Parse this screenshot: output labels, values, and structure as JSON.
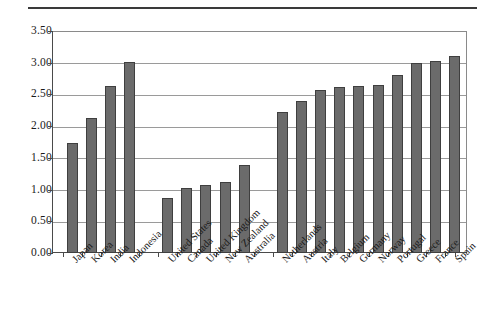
{
  "chart_data": {
    "type": "bar",
    "title": "",
    "subtitle": "",
    "xlabel": "",
    "ylabel": "",
    "ylim": [
      0.0,
      3.5
    ],
    "ytick_labels": [
      "0.00",
      "0.50",
      "1.00",
      "1.50",
      "2.00",
      "2.50",
      "3.00",
      "3.50"
    ],
    "ytick_values": [
      0.0,
      0.5,
      1.0,
      1.5,
      2.0,
      2.5,
      3.0,
      3.5
    ],
    "grid": true,
    "legend": "none",
    "bar_color": "#6b6b6b",
    "bar_edge_color": "#3f3f3f",
    "categories": [
      "Japan",
      "Korea",
      "India",
      "Indonesia",
      "United States",
      "Canada",
      "United Kingdom",
      "New Zealand",
      "Australia",
      "Netherlands",
      "Austria",
      "Italy",
      "Belgium",
      "Germany",
      "Norway",
      "Portugal",
      "Greece",
      "France",
      "Spain"
    ],
    "values": [
      1.73,
      2.13,
      2.63,
      3.01,
      0.87,
      1.02,
      1.07,
      1.12,
      1.39,
      2.23,
      2.4,
      2.57,
      2.62,
      2.64,
      2.65,
      2.81,
      3.0,
      3.02,
      3.11
    ],
    "group_breaks_after": [
      3,
      8
    ],
    "groups": [
      {
        "name": "Asia",
        "categories": [
          "Japan",
          "Korea",
          "India",
          "Indonesia"
        ]
      },
      {
        "name": "Anglosphere",
        "categories": [
          "United States",
          "Canada",
          "United Kingdom",
          "New Zealand",
          "Australia"
        ]
      },
      {
        "name": "Europe",
        "categories": [
          "Netherlands",
          "Austria",
          "Italy",
          "Belgium",
          "Germany",
          "Norway",
          "Portugal",
          "Greece",
          "France",
          "Spain"
        ]
      }
    ]
  }
}
